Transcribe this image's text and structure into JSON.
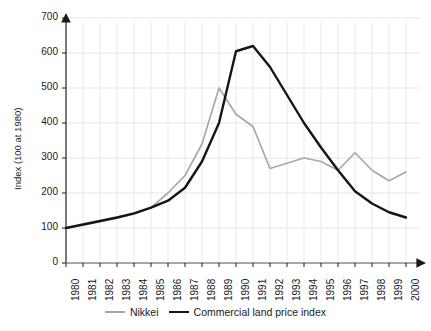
{
  "chart_data": {
    "type": "line",
    "title": "",
    "xlabel": "",
    "ylabel": "Index (100 at 1980)",
    "x": [
      1980,
      1981,
      1982,
      1983,
      1984,
      1985,
      1986,
      1987,
      1988,
      1989,
      1990,
      1991,
      1992,
      1993,
      1994,
      1995,
      1996,
      1997,
      1998,
      1999,
      2000
    ],
    "xticklabels": [
      "1980",
      "1981",
      "1982",
      "1983",
      "1984",
      "1985",
      "1986",
      "1987",
      "1988",
      "1989",
      "1990",
      "1991",
      "1992",
      "1993",
      "1994",
      "1995",
      "1996",
      "1997",
      "1998",
      "1999",
      "2000"
    ],
    "yticks": [
      0,
      100,
      200,
      300,
      400,
      500,
      600,
      700
    ],
    "yticklabels": [
      "0",
      "100",
      "200",
      "300",
      "400",
      "500",
      "600",
      "700"
    ],
    "ylim": [
      0,
      700
    ],
    "xlim": [
      1980,
      2000
    ],
    "grid": true,
    "legend_position": "bottom",
    "series": [
      {
        "name": "Nikkei",
        "color": "#a8a8a8",
        "values": [
          100,
          108,
          118,
          128,
          140,
          158,
          200,
          250,
          340,
          500,
          425,
          390,
          270,
          285,
          300,
          290,
          265,
          315,
          265,
          235,
          260
        ]
      },
      {
        "name": "Commercial land price index",
        "color": "#151515",
        "values": [
          100,
          110,
          120,
          130,
          142,
          158,
          178,
          215,
          290,
          400,
          605,
          620,
          560,
          480,
          400,
          330,
          265,
          205,
          170,
          145,
          130
        ]
      }
    ]
  },
  "axis": {
    "y_label": "Index (100 at 1980)"
  }
}
